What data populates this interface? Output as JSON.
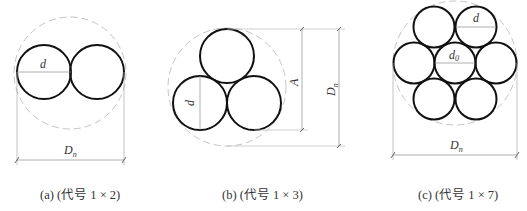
{
  "figure": {
    "panels": [
      {
        "id": "a",
        "caption": "(a) (代号 1 × 2)",
        "labels": {
          "wire_diameter": "d",
          "strand_diameter": "D",
          "strand_diameter_sub": "n"
        },
        "wire_count": 2
      },
      {
        "id": "b",
        "caption": "(b) (代号 1 × 3)",
        "labels": {
          "wire_diameter": "d",
          "height": "A",
          "strand_diameter": "D",
          "strand_diameter_sub": "n"
        },
        "wire_count": 3
      },
      {
        "id": "c",
        "caption": "(c) (代号 1 × 7)",
        "labels": {
          "wire_diameter": "d",
          "center_wire_diameter": "d",
          "center_wire_diameter_sub": "0",
          "strand_diameter": "D",
          "strand_diameter_sub": "n"
        },
        "wire_count": 7
      }
    ],
    "colors": {
      "wire_stroke": "#111111",
      "dashed_circle": "#bbbbbb",
      "dimension_line": "#999999",
      "text": "#333333"
    }
  }
}
